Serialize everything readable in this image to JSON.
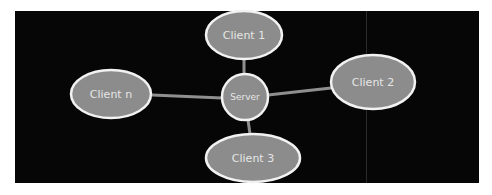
{
  "diagram": {
    "type": "star-topology",
    "background_color": "#060606",
    "node_fill": "#8c8c8c",
    "node_stroke": "#f2f2f2",
    "edge_color": "#8f8f8f",
    "label_color": "#e6e6e6",
    "center": {
      "id": "server",
      "label": "Server"
    },
    "nodes": [
      {
        "id": "client-1",
        "label": "Client 1"
      },
      {
        "id": "client-2",
        "label": "Client 2"
      },
      {
        "id": "client-3",
        "label": "Client 3"
      },
      {
        "id": "client-n",
        "label": "Client n"
      }
    ],
    "edges": [
      {
        "from": "server",
        "to": "client-1"
      },
      {
        "from": "server",
        "to": "client-2"
      },
      {
        "from": "server",
        "to": "client-3"
      },
      {
        "from": "server",
        "to": "client-n"
      }
    ]
  }
}
